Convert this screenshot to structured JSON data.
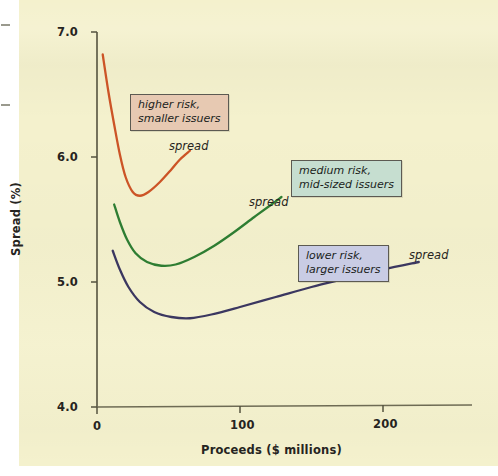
{
  "chart_data": {
    "type": "line",
    "title": "",
    "xlabel": "Proceeds ($ millions)",
    "ylabel": "Spread (%)",
    "xlim": [
      0,
      260
    ],
    "ylim": [
      4.0,
      7.0
    ],
    "x_ticks": [
      "0",
      "100",
      "200"
    ],
    "x_tick_values": [
      0,
      100,
      200
    ],
    "y_ticks": [
      "4.0",
      "5.0",
      "6.0",
      "7.0"
    ],
    "y_tick_values": [
      4.0,
      5.0,
      6.0,
      7.0
    ],
    "grid": false,
    "legend_position": "inline-callouts",
    "series": [
      {
        "name": "higher risk, smaller issuers",
        "color": "#cc5426",
        "point_label": "spread",
        "points": [
          {
            "x": 4,
            "y": 6.82
          },
          {
            "x": 8,
            "y": 6.52
          },
          {
            "x": 12,
            "y": 6.26
          },
          {
            "x": 16,
            "y": 6.02
          },
          {
            "x": 20,
            "y": 5.84
          },
          {
            "x": 25,
            "y": 5.72
          },
          {
            "x": 30,
            "y": 5.69
          },
          {
            "x": 36,
            "y": 5.72
          },
          {
            "x": 44,
            "y": 5.8
          },
          {
            "x": 52,
            "y": 5.9
          },
          {
            "x": 58,
            "y": 5.98
          },
          {
            "x": 65,
            "y": 6.05
          }
        ]
      },
      {
        "name": "medium risk, mid-sized issuers",
        "color": "#2e7d32",
        "point_label": "spread",
        "points": [
          {
            "x": 12,
            "y": 5.62
          },
          {
            "x": 16,
            "y": 5.48
          },
          {
            "x": 21,
            "y": 5.34
          },
          {
            "x": 27,
            "y": 5.23
          },
          {
            "x": 35,
            "y": 5.16
          },
          {
            "x": 45,
            "y": 5.13
          },
          {
            "x": 55,
            "y": 5.14
          },
          {
            "x": 68,
            "y": 5.2
          },
          {
            "x": 82,
            "y": 5.29
          },
          {
            "x": 96,
            "y": 5.4
          },
          {
            "x": 110,
            "y": 5.52
          },
          {
            "x": 122,
            "y": 5.62
          },
          {
            "x": 129,
            "y": 5.68
          }
        ]
      },
      {
        "name": "lower risk, larger issuers",
        "color": "#3b3760",
        "point_label": "spread",
        "points": [
          {
            "x": 11,
            "y": 5.25
          },
          {
            "x": 16,
            "y": 5.1
          },
          {
            "x": 22,
            "y": 4.96
          },
          {
            "x": 30,
            "y": 4.84
          },
          {
            "x": 40,
            "y": 4.76
          },
          {
            "x": 52,
            "y": 4.72
          },
          {
            "x": 65,
            "y": 4.71
          },
          {
            "x": 80,
            "y": 4.74
          },
          {
            "x": 100,
            "y": 4.8
          },
          {
            "x": 125,
            "y": 4.88
          },
          {
            "x": 150,
            "y": 4.96
          },
          {
            "x": 175,
            "y": 5.03
          },
          {
            "x": 200,
            "y": 5.1
          },
          {
            "x": 225,
            "y": 5.16
          }
        ]
      }
    ],
    "annotations": [
      {
        "id": "higher-risk",
        "line1": "higher risk,",
        "line2": "smaller issuers",
        "box_color": "#e7c9b2",
        "border_color": "#5c5a52"
      },
      {
        "id": "medium-risk",
        "line1": "medium risk,",
        "line2": "mid-sized issuers",
        "box_color": "#c6ded0",
        "border_color": "#5c5a52"
      },
      {
        "id": "lower-risk",
        "line1": "lower risk,",
        "line2": "larger issuers",
        "box_color": "#c9cce4",
        "border_color": "#5c5a52"
      }
    ],
    "spread_labels": [
      "spread",
      "spread",
      "spread"
    ],
    "colors": {
      "background": "#f4f1cd",
      "axis": "#55533f",
      "text": "#262421",
      "series_high_risk": "#cc5426",
      "series_medium_risk": "#2e7d32",
      "series_low_risk": "#3b3760"
    }
  }
}
